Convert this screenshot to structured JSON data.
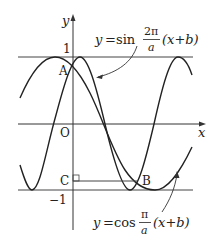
{
  "diagram": {
    "axis_labels": {
      "x": "x",
      "y": "y",
      "origin": "O"
    },
    "tick_labels": {
      "one": "1",
      "minus_one": "−1"
    },
    "points": {
      "A": "A",
      "B": "B",
      "C": "C"
    },
    "sin_label": {
      "y": "y",
      "eq": "=",
      "fn": "sin",
      "num": "2π",
      "den": "a",
      "arg": "(x+b)"
    },
    "cos_label": {
      "y": "y",
      "eq": "=",
      "fn": "cos",
      "num": "π",
      "den": "a",
      "arg": "(x+b)"
    },
    "colors": {
      "curve": "#222222",
      "axis": "#333333",
      "line": "#444444"
    }
  }
}
